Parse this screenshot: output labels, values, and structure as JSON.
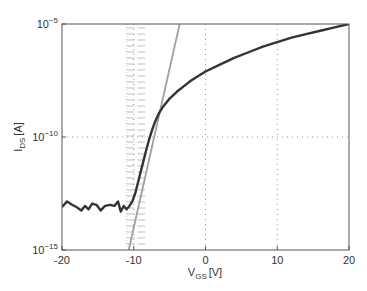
{
  "chart_data": {
    "type": "line",
    "title": "",
    "xlabel": "V_GS [V]",
    "ylabel": "I_DS [A]",
    "xlabel_main": "V",
    "xlabel_sub": "GS",
    "xlabel_unit": "[V]",
    "ylabel_main": "I",
    "ylabel_sub": "DS",
    "ylabel_unit": "[A]",
    "xlim": [
      -20,
      20
    ],
    "ylim_log10": [
      -15,
      -5
    ],
    "yscale": "log",
    "x_ticks": [
      "-20",
      "-10",
      "0",
      "10",
      "20"
    ],
    "x_tick_values": [
      -20,
      -10,
      0,
      10,
      20
    ],
    "y_ticks": [
      {
        "base": "10",
        "exp": "-5",
        "value_log10": -5
      },
      {
        "base": "10",
        "exp": "-10",
        "value_log10": -10
      },
      {
        "base": "10",
        "exp": "-15",
        "value_log10": -15
      }
    ],
    "grid": "dotted at x=-10,0,10 and y=1e-10",
    "series": [
      {
        "name": "I_DS measured",
        "color": "#333333",
        "x": [
          -20,
          -19.3,
          -18.6,
          -18,
          -17.3,
          -16.8,
          -16.3,
          -15.8,
          -15.2,
          -14.6,
          -14,
          -13.3,
          -12.7,
          -12.2,
          -11.8,
          -11.4,
          -11,
          -10.6,
          -10.2,
          -9.8,
          -9.4,
          -9,
          -8.6,
          -8.2,
          -7.8,
          -7.4,
          -7,
          -6.5,
          -6,
          -5,
          -4,
          -3,
          -2,
          -1,
          0,
          2,
          4,
          6,
          8,
          10,
          12,
          14,
          16,
          18,
          20
        ],
        "y_log10": [
          -13.1,
          -12.85,
          -13.0,
          -13.1,
          -13.25,
          -13.05,
          -13.2,
          -12.95,
          -13.0,
          -13.25,
          -13.05,
          -13.0,
          -13.05,
          -12.85,
          -13.3,
          -13.05,
          -13.2,
          -13.05,
          -12.85,
          -12.5,
          -12.0,
          -11.5,
          -11.0,
          -10.5,
          -10.05,
          -9.65,
          -9.3,
          -8.95,
          -8.7,
          -8.3,
          -8.0,
          -7.75,
          -7.5,
          -7.3,
          -7.1,
          -6.8,
          -6.5,
          -6.25,
          -6.0,
          -5.8,
          -5.6,
          -5.45,
          -5.3,
          -5.15,
          -5.0
        ]
      },
      {
        "name": "subthreshold slope fit",
        "color": "#a0a0a0",
        "x": [
          -10.7,
          -3.6
        ],
        "y_log10": [
          -15,
          -5
        ]
      }
    ],
    "annotations": [
      {
        "type": "hatched-band",
        "x_range": [
          -11.0,
          -8.4
        ],
        "style": "horizontal dashes",
        "color": "#b0b0b0"
      }
    ]
  },
  "colors": {
    "axis": "#555555",
    "grid": "#999999",
    "curve": "#333333",
    "fit": "#a0a0a0",
    "hatch": "#b0b0b0"
  }
}
